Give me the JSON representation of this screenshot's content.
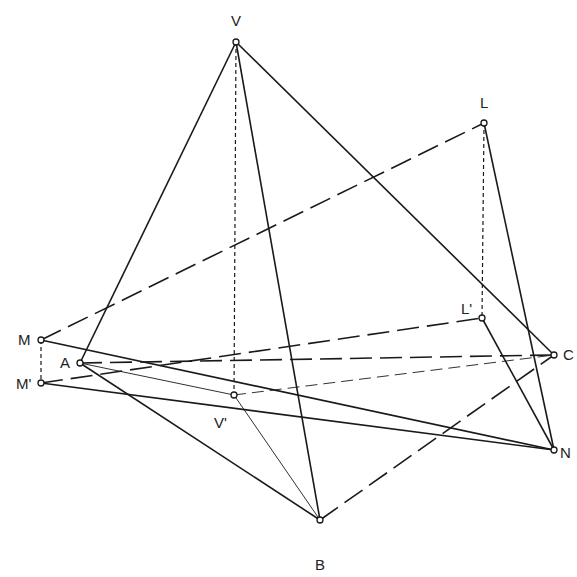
{
  "diagram": {
    "title": "",
    "points": {
      "V": {
        "label": "V",
        "x": 236,
        "y": 42,
        "lx": 231,
        "ly": 26
      },
      "L": {
        "label": "L",
        "x": 484,
        "y": 123,
        "lx": 480,
        "ly": 108
      },
      "Lp": {
        "label": "L'",
        "x": 482,
        "y": 318,
        "lx": 461,
        "ly": 314
      },
      "M": {
        "label": "M",
        "x": 41,
        "y": 340,
        "lx": 18,
        "ly": 345
      },
      "Mp": {
        "label": "M'",
        "x": 41,
        "y": 383,
        "lx": 16,
        "ly": 389
      },
      "A": {
        "label": "A",
        "x": 80,
        "y": 363,
        "lx": 60,
        "ly": 368
      },
      "C": {
        "label": "C",
        "x": 554,
        "y": 355,
        "lx": 563,
        "ly": 360
      },
      "N": {
        "label": "N",
        "x": 554,
        "y": 450,
        "lx": 560,
        "ly": 458
      },
      "Vp": {
        "label": "V'",
        "x": 234,
        "y": 395,
        "lx": 214,
        "ly": 428
      },
      "B": {
        "label": "B",
        "x": 320,
        "y": 520,
        "lx": 315,
        "ly": 570
      }
    },
    "lines": [
      {
        "from": "V",
        "to": "A",
        "style": "solid"
      },
      {
        "from": "V",
        "to": "B",
        "style": "solid"
      },
      {
        "from": "V",
        "to": "C",
        "style": "solid"
      },
      {
        "from": "V",
        "to": "Vp",
        "style": "dashed"
      },
      {
        "from": "L",
        "to": "Lp",
        "style": "dashed"
      },
      {
        "from": "M",
        "to": "Mp",
        "style": "dashed"
      },
      {
        "from": "M",
        "to": "L",
        "style": "longdash"
      },
      {
        "from": "L",
        "to": "N",
        "style": "solid"
      },
      {
        "from": "Lp",
        "to": "N",
        "style": "solid"
      },
      {
        "from": "Mp",
        "to": "Lp",
        "style": "longdash"
      },
      {
        "from": "M",
        "to": "N",
        "style": "solid"
      },
      {
        "from": "Mp",
        "to": "N",
        "style": "solid"
      },
      {
        "from": "A",
        "to": "C",
        "style": "longdash"
      },
      {
        "from": "A",
        "to": "Vp",
        "style": "thin"
      },
      {
        "from": "Vp",
        "to": "C",
        "style": "thindash"
      },
      {
        "from": "Vp",
        "to": "B",
        "style": "thin"
      },
      {
        "from": "A",
        "to": "B",
        "style": "solid"
      },
      {
        "from": "B",
        "to": "C",
        "style": "longdash"
      }
    ]
  }
}
